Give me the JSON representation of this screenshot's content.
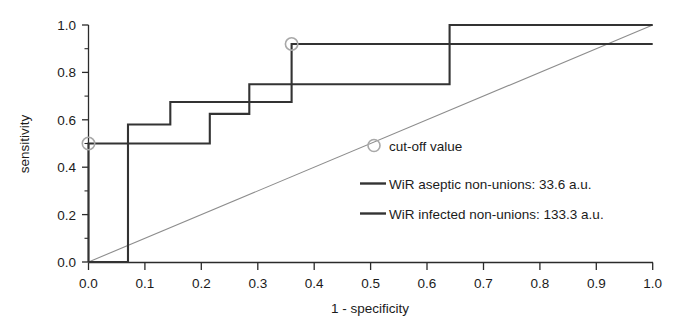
{
  "chart_data": {
    "type": "line",
    "title": "",
    "xlabel": "1 - specificity",
    "ylabel": "sensitivity",
    "xlim": [
      0.0,
      1.0
    ],
    "ylim": [
      0.0,
      1.0
    ],
    "xticks": [
      "0.0",
      "0.1",
      "0.2",
      "0.3",
      "0.4",
      "0.5",
      "0.6",
      "0.7",
      "0.8",
      "0.9",
      "1.0"
    ],
    "yticks": [
      "0.0",
      "0.2",
      "0.4",
      "0.6",
      "0.8",
      "1.0"
    ],
    "xtick_values": [
      0.0,
      0.1,
      0.2,
      0.3,
      0.4,
      0.5,
      0.6,
      0.7,
      0.8,
      0.9,
      1.0
    ],
    "ytick_values": [
      0.0,
      0.2,
      0.4,
      0.6,
      0.8,
      1.0
    ],
    "minor_tick_step": 0.1,
    "grid": false,
    "legend_position": "center-right",
    "reference_line": {
      "label": "chance diagonal",
      "from": [
        0.0,
        0.0
      ],
      "to": [
        1.0,
        1.0
      ],
      "color": "#8d8d8d"
    },
    "series": [
      {
        "name": "WiR aseptic non-unions: 33.6 a.u.",
        "color": "#333333",
        "cutoff_value": "33.6 a.u.",
        "cutoff_point": [
          0.0,
          0.5
        ],
        "points": [
          [
            0.0,
            0.0
          ],
          [
            0.0,
            0.5
          ],
          [
            0.215,
            0.5
          ],
          [
            0.215,
            0.625
          ],
          [
            0.285,
            0.625
          ],
          [
            0.285,
            0.75
          ],
          [
            0.64,
            0.75
          ],
          [
            0.64,
            1.0
          ],
          [
            1.0,
            1.0
          ]
        ]
      },
      {
        "name": "WiR infected non-unions: 133.3 a.u.",
        "color": "#333333",
        "cutoff_value": "133.3 a.u.",
        "cutoff_point": [
          0.36,
          0.92
        ],
        "points": [
          [
            0.0,
            0.0
          ],
          [
            0.07,
            0.0
          ],
          [
            0.07,
            0.58
          ],
          [
            0.145,
            0.58
          ],
          [
            0.145,
            0.675
          ],
          [
            0.36,
            0.675
          ],
          [
            0.36,
            0.92
          ],
          [
            1.0,
            0.92
          ]
        ]
      }
    ],
    "legend_entries": [
      {
        "marker": "circle-open",
        "label": "cut-off value"
      },
      {
        "marker": "line",
        "label": "WiR aseptic non-unions: 33.6 a.u."
      },
      {
        "marker": "line",
        "label": "WiR infected non-unions: 133.3 a.u."
      }
    ],
    "cutoff_markers": [
      {
        "x": 0.0,
        "y": 0.5
      },
      {
        "x": 0.36,
        "y": 0.92
      }
    ]
  }
}
